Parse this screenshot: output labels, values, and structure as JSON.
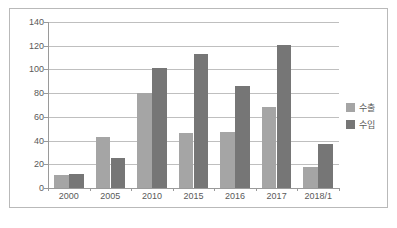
{
  "chart_data": {
    "type": "bar",
    "title": "",
    "subtitle": "",
    "xlabel": "",
    "ylabel": "",
    "categories": [
      "2000",
      "2005",
      "2010",
      "2015",
      "2016",
      "2017",
      "2018/1"
    ],
    "series": [
      {
        "name": "수출",
        "color": "#a5a5a5",
        "values": [
          11,
          43,
          80,
          46,
          47,
          68,
          18
        ]
      },
      {
        "name": "수입",
        "color": "#767676",
        "values": [
          12,
          25,
          101,
          113,
          86,
          121,
          37
        ]
      }
    ],
    "ylim": [
      0,
      140
    ],
    "ytick_step": 20,
    "yticks": [
      "140",
      "120",
      "100",
      "80",
      "60",
      "40",
      "20",
      "0"
    ],
    "ytick_values": [
      140,
      120,
      100,
      80,
      60,
      40,
      20,
      0
    ],
    "grid": true,
    "legend_position": "right",
    "legend": [
      "수출",
      "수입"
    ],
    "annotations": []
  },
  "frame": {
    "border_color": "#b9b9b9",
    "background": "#ffffff"
  },
  "axis": {
    "line_color": "#9a9a9a",
    "gridline_color": "#bfbfbf",
    "tick_text_color": "#595959"
  }
}
